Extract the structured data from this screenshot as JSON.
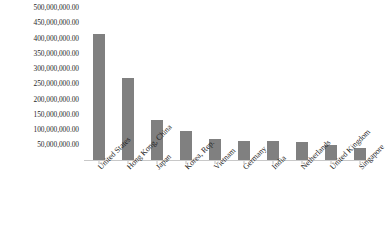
{
  "chart_data": {
    "type": "bar",
    "title": "",
    "subtitle": "",
    "xlabel": "",
    "ylabel": "",
    "legend": [],
    "grid": false,
    "legend_position": "none",
    "bar_color": "#808080",
    "ylim": [
      0,
      500000000
    ],
    "ytick_step": 50000000,
    "y_tick_labels": [
      "500,000,000.00",
      "450,000,000.00",
      "400,000,000.00",
      "350,000,000.00",
      "300,000,000.00",
      "250,000,000.00",
      "200,000,000.00",
      "150,000,000.00",
      "100,000,000.00",
      "50,000,000.00"
    ],
    "y_tick_values": [
      500000000,
      450000000,
      400000000,
      350000000,
      300000000,
      250000000,
      200000000,
      150000000,
      100000000,
      50000000
    ],
    "categories": [
      "United States",
      "Hong Kong, China",
      "Japan",
      "Korea, Rep.",
      "Vietnam",
      "Germany",
      "India",
      "Netherlands",
      "United Kingdom",
      "Singapore"
    ],
    "values": [
      415000000,
      270000000,
      132000000,
      98000000,
      70000000,
      64000000,
      63000000,
      61000000,
      51000000,
      42000000
    ]
  }
}
